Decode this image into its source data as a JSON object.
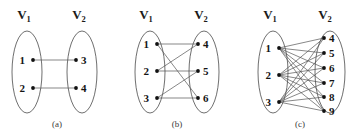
{
  "figure": {
    "background_color": "#ffffff",
    "ink_color": "#111111",
    "edge_color": "#555555",
    "hull_color": "#4a4a4a",
    "panels": [
      {
        "id": "a",
        "caption": "(a)",
        "caption_pos": {
          "x": 57,
          "y": 127
        },
        "set_labels": [
          {
            "name": "V",
            "subscript": "1",
            "x": 24,
            "y": 19
          },
          {
            "name": "V",
            "subscript": "2",
            "x": 79,
            "y": 19
          }
        ],
        "hulls": [
          {
            "cx": 27,
            "cy": 72,
            "rx": 15,
            "ry": 41
          },
          {
            "cx": 82,
            "cy": 72,
            "rx": 15,
            "ry": 41
          }
        ],
        "nodes": [
          {
            "id": "1",
            "x": 33,
            "y": 60,
            "label": "1",
            "label_x": 25,
            "label_y": 64,
            "side": "left"
          },
          {
            "id": "2",
            "x": 33,
            "y": 88,
            "label": "2",
            "label_x": 25,
            "label_y": 92,
            "side": "left"
          },
          {
            "id": "3",
            "x": 76,
            "y": 60,
            "label": "3",
            "label_x": 81,
            "label_y": 64,
            "side": "right"
          },
          {
            "id": "4",
            "x": 76,
            "y": 88,
            "label": "4",
            "label_x": 81,
            "label_y": 92,
            "side": "right"
          }
        ],
        "edges": [
          {
            "from": "1",
            "to": "3"
          },
          {
            "from": "2",
            "to": "4"
          }
        ]
      },
      {
        "id": "b",
        "caption": "(b)",
        "caption_pos": {
          "x": 177,
          "y": 127
        },
        "set_labels": [
          {
            "name": "V",
            "subscript": "1",
            "x": 146,
            "y": 19
          },
          {
            "name": "V",
            "subscript": "2",
            "x": 201,
            "y": 19
          }
        ],
        "hulls": [
          {
            "cx": 150,
            "cy": 72,
            "rx": 15,
            "ry": 41
          },
          {
            "cx": 204,
            "cy": 72,
            "rx": 15,
            "ry": 41
          }
        ],
        "nodes": [
          {
            "id": "1",
            "x": 157,
            "y": 44,
            "label": "1",
            "label_x": 149,
            "label_y": 48,
            "side": "left"
          },
          {
            "id": "2",
            "x": 157,
            "y": 71,
            "label": "2",
            "label_x": 149,
            "label_y": 75,
            "side": "left"
          },
          {
            "id": "3",
            "x": 157,
            "y": 98,
            "label": "3",
            "label_x": 149,
            "label_y": 102,
            "side": "left"
          },
          {
            "id": "4",
            "x": 198,
            "y": 44,
            "label": "4",
            "label_x": 203,
            "label_y": 48,
            "side": "right"
          },
          {
            "id": "5",
            "x": 198,
            "y": 71,
            "label": "5",
            "label_x": 203,
            "label_y": 75,
            "side": "right"
          },
          {
            "id": "6",
            "x": 198,
            "y": 98,
            "label": "6",
            "label_x": 203,
            "label_y": 102,
            "side": "right"
          }
        ],
        "edges": [
          {
            "from": "1",
            "to": "4"
          },
          {
            "from": "1",
            "to": "6"
          },
          {
            "from": "2",
            "to": "4"
          },
          {
            "from": "2",
            "to": "5"
          },
          {
            "from": "3",
            "to": "5"
          },
          {
            "from": "3",
            "to": "6"
          }
        ]
      },
      {
        "id": "c",
        "caption": "(c)",
        "caption_pos": {
          "x": 300,
          "y": 127
        },
        "set_labels": [
          {
            "name": "V",
            "subscript": "1",
            "x": 270,
            "y": 19
          },
          {
            "name": "V",
            "subscript": "2",
            "x": 325,
            "y": 19
          }
        ],
        "hulls": [
          {
            "cx": 273,
            "cy": 72,
            "rx": 15,
            "ry": 41
          },
          {
            "cx": 330,
            "cy": 72,
            "rx": 15,
            "ry": 41
          }
        ],
        "nodes": [
          {
            "id": "1",
            "x": 279,
            "y": 48,
            "label": "1",
            "label_x": 271,
            "label_y": 52,
            "side": "left"
          },
          {
            "id": "2",
            "x": 279,
            "y": 75,
            "label": "2",
            "label_x": 271,
            "label_y": 79,
            "side": "left"
          },
          {
            "id": "3",
            "x": 279,
            "y": 102,
            "label": "3",
            "label_x": 271,
            "label_y": 106,
            "side": "left"
          },
          {
            "id": "4",
            "x": 324,
            "y": 38,
            "label": "4",
            "label_x": 329,
            "label_y": 42,
            "side": "right"
          },
          {
            "id": "5",
            "x": 324,
            "y": 53,
            "label": "5",
            "label_x": 329,
            "label_y": 57,
            "side": "right"
          },
          {
            "id": "6",
            "x": 324,
            "y": 68,
            "label": "6",
            "label_x": 329,
            "label_y": 72,
            "side": "right"
          },
          {
            "id": "7",
            "x": 324,
            "y": 83,
            "label": "7",
            "label_x": 329,
            "label_y": 87,
            "side": "right"
          },
          {
            "id": "8",
            "x": 324,
            "y": 97,
            "label": "8",
            "label_x": 329,
            "label_y": 101,
            "side": "right"
          },
          {
            "id": "9",
            "x": 324,
            "y": 111,
            "label": "9",
            "label_x": 329,
            "label_y": 115,
            "side": "right"
          }
        ],
        "edges": [
          {
            "from": "1",
            "to": "4"
          },
          {
            "from": "1",
            "to": "5"
          },
          {
            "from": "1",
            "to": "6"
          },
          {
            "from": "1",
            "to": "7"
          },
          {
            "from": "1",
            "to": "8"
          },
          {
            "from": "1",
            "to": "9"
          },
          {
            "from": "2",
            "to": "4"
          },
          {
            "from": "2",
            "to": "5"
          },
          {
            "from": "2",
            "to": "6"
          },
          {
            "from": "2",
            "to": "7"
          },
          {
            "from": "2",
            "to": "8"
          },
          {
            "from": "2",
            "to": "9"
          },
          {
            "from": "3",
            "to": "4"
          },
          {
            "from": "3",
            "to": "5"
          },
          {
            "from": "3",
            "to": "6"
          },
          {
            "from": "3",
            "to": "7"
          },
          {
            "from": "3",
            "to": "8"
          },
          {
            "from": "3",
            "to": "9"
          }
        ]
      }
    ]
  }
}
